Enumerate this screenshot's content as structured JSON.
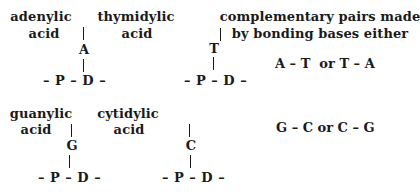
{
  "nucleotides": [
    {
      "name_line1": "adenylic",
      "name_line2": "acid",
      "base": "A",
      "backbone": "– P – D –"
    },
    {
      "name_line1": "thymidylic",
      "name_line2": "acid",
      "base": "T",
      "backbone": "– P – D –"
    },
    {
      "name_line1": "guanylic",
      "name_line2": "acid",
      "base": "G",
      "backbone": "– P – D –"
    },
    {
      "name_line1": "cytidylic",
      "name_line2": "acid",
      "base": "C",
      "backbone": "– P – D –"
    }
  ],
  "pairs_note": {
    "line1": "complementary pairs made",
    "line2": "by bonding bases either"
  },
  "pairs": [
    {
      "text": "A – T  or T – A"
    },
    {
      "text": "G – C or C – G"
    }
  ]
}
